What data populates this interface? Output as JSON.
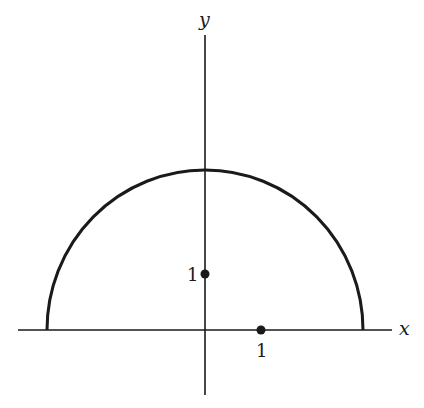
{
  "diagram": {
    "type": "coordinate-plot",
    "axes": {
      "x_label": "x",
      "y_label": "y"
    },
    "points": [
      {
        "name": "y-unit-point",
        "label": "1",
        "coords": [
          0,
          1
        ]
      },
      {
        "name": "x-unit-point",
        "label": "1",
        "coords": [
          1,
          0
        ]
      }
    ],
    "curve": {
      "name": "upper-semicircle",
      "center": [
        0,
        0
      ],
      "radius_units": 2.83
    },
    "colors": {
      "stroke": "#1a1a1a",
      "background": "#ffffff"
    }
  }
}
